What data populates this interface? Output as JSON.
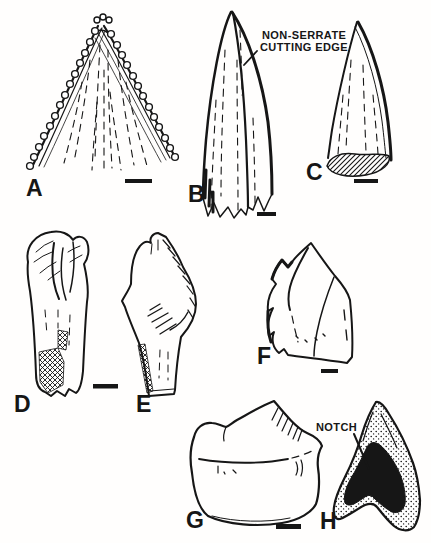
{
  "figure": {
    "paper_color": "#fffefd",
    "ink_color": "#161616",
    "panels": [
      {
        "label": "A",
        "subject": "serrated-tooth-tip-front-view"
      },
      {
        "label": "B",
        "subject": "tall-non-serrate-tooth"
      },
      {
        "label": "C",
        "subject": "recurved-conical-tooth-hatched-base"
      },
      {
        "label": "D",
        "subject": "tooth-with-root-front-view"
      },
      {
        "label": "E",
        "subject": "tooth-with-root-side-view"
      },
      {
        "label": "F",
        "subject": "bicuspid-tooth-fragment"
      },
      {
        "label": "G",
        "subject": "molariform-tooth-lateral-view"
      },
      {
        "label": "H",
        "subject": "molariform-tooth-occlusal-view-dark-basin"
      }
    ],
    "annotations": {
      "cutting_edge_line1": "NON-SERRATE",
      "cutting_edge_line2": "CUTTING EDGE",
      "notch": "NOTCH"
    }
  }
}
